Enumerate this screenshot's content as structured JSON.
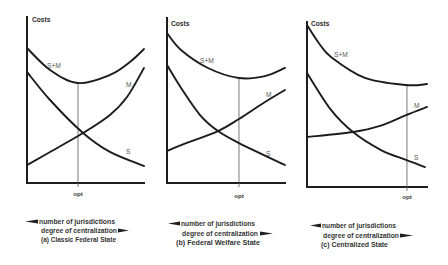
{
  "figure": {
    "icons": {
      "decrease_arrow": "arrow-left-icon",
      "increase_arrow": "arrow-right-icon"
    },
    "colors": {
      "ink": "#1e1e1e",
      "label": "#555555",
      "background": "#ffffff"
    }
  },
  "chart_data": [
    {
      "type": "line",
      "title": "(a) Classic Federal State",
      "ylabel": "Costs",
      "xlabel_lines": [
        "number of jurisdictions",
        "degree of centralization"
      ],
      "xlabel_direction": {
        "number of jurisdictions": "increases to the left",
        "degree of centralization": "increases to the right"
      },
      "x_ticks": [
        "opt"
      ],
      "xlim": [
        0,
        100
      ],
      "ylim": [
        0,
        100
      ],
      "grid": false,
      "legend": "inline curve labels",
      "opt": {
        "x": 43.6,
        "min_cost": 60.2
      },
      "series": [
        {
          "name": "S+M",
          "points": [
            [
              0,
              81.3
            ],
            [
              19.7,
              68.1
            ],
            [
              43.6,
              60.2
            ],
            [
              70.9,
              65.1
            ],
            [
              88.0,
              72.9
            ],
            [
              100,
              80.7
            ]
          ]
        },
        {
          "name": "M",
          "points": [
            [
              0,
              10.8
            ],
            [
              19.7,
              18.7
            ],
            [
              47.9,
              30.1
            ],
            [
              70.9,
              41.0
            ],
            [
              85.5,
              51.8
            ],
            [
              100,
              69.3
            ]
          ]
        },
        {
          "name": "S",
          "points": [
            [
              0,
              66.9
            ],
            [
              19.7,
              50.0
            ],
            [
              47.9,
              30.1
            ],
            [
              70.9,
              18.7
            ],
            [
              100,
              10.2
            ]
          ]
        }
      ]
    },
    {
      "type": "line",
      "title": "(b) Federal Welfare State",
      "ylabel": "Costs",
      "xlabel_lines": [
        "number of jurisdictions",
        "degree of centralization"
      ],
      "xlabel_direction": {
        "number of jurisdictions": "increases to the left",
        "degree of centralization": "increases to the right"
      },
      "x_ticks": [
        "opt"
      ],
      "xlim": [
        0,
        100
      ],
      "ylim": [
        0,
        100
      ],
      "grid": false,
      "legend": "inline curve labels",
      "opt": {
        "x": 61.0,
        "min_cost": 63.6
      },
      "series": [
        {
          "name": "S+M",
          "points": [
            [
              0,
              90.9
            ],
            [
              11.9,
              80.6
            ],
            [
              34.7,
              69.7
            ],
            [
              61.0,
              63.6
            ],
            [
              83.1,
              64.8
            ],
            [
              100,
              69.7
            ]
          ]
        },
        {
          "name": "M",
          "points": [
            [
              0,
              19.4
            ],
            [
              11.9,
              23.0
            ],
            [
              43.2,
              31.5
            ],
            [
              61.0,
              38.8
            ],
            [
              80.5,
              47.9
            ],
            [
              100,
              56.4
            ]
          ]
        },
        {
          "name": "S",
          "points": [
            [
              0,
              71.5
            ],
            [
              11.9,
              57.6
            ],
            [
              28.0,
              41.2
            ],
            [
              43.2,
              31.5
            ],
            [
              61.0,
              24.2
            ],
            [
              100,
              10.9
            ]
          ]
        }
      ]
    },
    {
      "type": "line",
      "title": "(c) Centralized State",
      "ylabel": "Costs",
      "xlabel_lines": [
        "number of jurisdictions",
        "degree of centralization"
      ],
      "xlabel_direction": {
        "number of jurisdictions": "increases to the left",
        "degree of centralization": "increases to the right"
      },
      "x_ticks": [
        "opt"
      ],
      "xlim": [
        0,
        100
      ],
      "ylim": [
        0,
        100
      ],
      "grid": false,
      "legend": "inline curve labels",
      "opt": {
        "x": 83.3,
        "min_cost": 61.8
      },
      "series": [
        {
          "name": "S+M",
          "points": [
            [
              0,
              98.2
            ],
            [
              9.2,
              87.9
            ],
            [
              20.0,
              78.8
            ],
            [
              48.3,
              66.1
            ],
            [
              82.5,
              61.8
            ],
            [
              100,
              62.4
            ]
          ]
        },
        {
          "name": "M",
          "points": [
            [
              0,
              30.3
            ],
            [
              38.3,
              33.3
            ],
            [
              60.8,
              37.0
            ],
            [
              82.5,
              43.6
            ],
            [
              100,
              48.5
            ]
          ]
        },
        {
          "name": "S",
          "points": [
            [
              0,
              69.1
            ],
            [
              20.0,
              46.7
            ],
            [
              38.3,
              33.3
            ],
            [
              61.7,
              22.4
            ],
            [
              82.5,
              16.4
            ],
            [
              98.3,
              12.1
            ]
          ]
        }
      ]
    }
  ]
}
